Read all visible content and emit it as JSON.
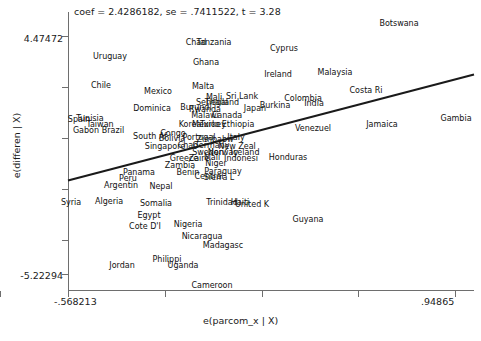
{
  "chart_data": {
    "type": "scatter",
    "title": "coef = 2.4286182, se = .7411522, t = 3.28",
    "xlabel": "e(parcom_x | X)",
    "ylabel": "e(differen | X)",
    "xlim": [
      -0.568213,
      0.94865
    ],
    "ylim": [
      -5.22294,
      4.47472
    ],
    "xticklabels": [
      "-.568213",
      ".94865"
    ],
    "yticklabels": [
      "4.47472",
      "-5.22294"
    ],
    "grid": false,
    "legend": null,
    "marker_style": "text-label",
    "n_xticks": 6,
    "n_yticks": 6,
    "fit_line": {
      "slope": 2.4286182,
      "se": 0.7411522,
      "t": 3.28,
      "color": "#1a1a1a",
      "x_start": -0.568213,
      "x_end": 0.94865
    },
    "points": [
      {
        "label": "Botswana",
        "px": 399,
        "py": 23
      },
      {
        "label": "Chad",
        "px": 196,
        "py": 42
      },
      {
        "label": "Tanzania",
        "px": 214,
        "py": 42
      },
      {
        "label": "Cyprus",
        "px": 284,
        "py": 48
      },
      {
        "label": "Uruguay",
        "px": 110,
        "py": 56
      },
      {
        "label": "Ghana",
        "px": 206,
        "py": 62
      },
      {
        "label": "Ireland",
        "px": 278,
        "py": 74
      },
      {
        "label": "Malaysia",
        "px": 335,
        "py": 72
      },
      {
        "label": "Chile",
        "px": 101,
        "py": 85
      },
      {
        "label": "Mexico",
        "px": 158,
        "py": 91
      },
      {
        "label": "Malta",
        "px": 203,
        "py": 86
      },
      {
        "label": "Costa Ri",
        "px": 366,
        "py": 90
      },
      {
        "label": "Mali",
        "px": 214,
        "py": 97
      },
      {
        "label": "Sri Lank",
        "px": 242,
        "py": 96
      },
      {
        "label": "Colombia",
        "px": 303,
        "py": 98
      },
      {
        "label": "India",
        "px": 314,
        "py": 103
      },
      {
        "label": "Senegal",
        "px": 212,
        "py": 102
      },
      {
        "label": "Thailand",
        "px": 222,
        "py": 102
      },
      {
        "label": "Burkina",
        "px": 275,
        "py": 105
      },
      {
        "label": "Dominica",
        "px": 152,
        "py": 108
      },
      {
        "label": "Burundi",
        "px": 196,
        "py": 107
      },
      {
        "label": "Rwanda",
        "px": 205,
        "py": 109
      },
      {
        "label": "Japan",
        "px": 255,
        "py": 108
      },
      {
        "label": "Spain",
        "px": 79,
        "py": 119
      },
      {
        "label": "Tunisia",
        "px": 90,
        "py": 118
      },
      {
        "label": "Malawi",
        "px": 205,
        "py": 115
      },
      {
        "label": "Canada",
        "px": 227,
        "py": 115
      },
      {
        "label": "Taiwan",
        "px": 100,
        "py": 124
      },
      {
        "label": "Gabon",
        "px": 86,
        "py": 130
      },
      {
        "label": "Brazil",
        "px": 113,
        "py": 130
      },
      {
        "label": "Korea",
        "px": 190,
        "py": 124
      },
      {
        "label": "Mexico2",
        "px": 206,
        "py": 124
      },
      {
        "label": "Turkey",
        "px": 213,
        "py": 124
      },
      {
        "label": "Ethiopia",
        "px": 238,
        "py": 124
      },
      {
        "label": "Venezuel",
        "px": 313,
        "py": 128
      },
      {
        "label": "Jamaica",
        "px": 382,
        "py": 124
      },
      {
        "label": "Gambia",
        "px": 456,
        "py": 118
      },
      {
        "label": "South Af",
        "px": 150,
        "py": 136
      },
      {
        "label": "Congo",
        "px": 173,
        "py": 133
      },
      {
        "label": "Bolivia",
        "px": 172,
        "py": 138
      },
      {
        "label": "Portugal",
        "px": 199,
        "py": 137
      },
      {
        "label": "Zimbabw",
        "px": 215,
        "py": 139
      },
      {
        "label": "Italy",
        "px": 236,
        "py": 137
      },
      {
        "label": "Singapore",
        "px": 165,
        "py": 146
      },
      {
        "label": "Chad2",
        "px": 188,
        "py": 145
      },
      {
        "label": "Germany",
        "px": 211,
        "py": 145
      },
      {
        "label": "New Zeal",
        "px": 237,
        "py": 146
      },
      {
        "label": "Sweden",
        "px": 208,
        "py": 152
      },
      {
        "label": "Norway",
        "px": 223,
        "py": 152
      },
      {
        "label": "Iceland",
        "px": 245,
        "py": 152
      },
      {
        "label": "Greece",
        "px": 184,
        "py": 158
      },
      {
        "label": "Zaire",
        "px": 199,
        "py": 158
      },
      {
        "label": "Mali2",
        "px": 212,
        "py": 157
      },
      {
        "label": "Indonesi",
        "px": 241,
        "py": 158
      },
      {
        "label": "Honduras",
        "px": 288,
        "py": 157
      },
      {
        "label": "Zambia",
        "px": 180,
        "py": 165
      },
      {
        "label": "Niger",
        "px": 216,
        "py": 163
      },
      {
        "label": "Panama",
        "px": 139,
        "py": 172
      },
      {
        "label": "Benin",
        "px": 188,
        "py": 172
      },
      {
        "label": "Paraguay",
        "px": 223,
        "py": 171
      },
      {
        "label": "Peru",
        "px": 128,
        "py": 178
      },
      {
        "label": "Central",
        "px": 209,
        "py": 176
      },
      {
        "label": "Sierra L",
        "px": 219,
        "py": 177
      },
      {
        "label": "Argentin",
        "px": 121,
        "py": 185
      },
      {
        "label": "Nepal",
        "px": 161,
        "py": 186
      },
      {
        "label": "Syria",
        "px": 71,
        "py": 202
      },
      {
        "label": "Algeria",
        "px": 109,
        "py": 201
      },
      {
        "label": "Somalia",
        "px": 156,
        "py": 203
      },
      {
        "label": "Trinidad",
        "px": 222,
        "py": 202
      },
      {
        "label": "Haiti",
        "px": 240,
        "py": 202
      },
      {
        "label": "United K",
        "px": 252,
        "py": 204
      },
      {
        "label": "Egypt",
        "px": 149,
        "py": 215
      },
      {
        "label": "Cote D'I",
        "px": 145,
        "py": 226
      },
      {
        "label": "Nigeria",
        "px": 188,
        "py": 224
      },
      {
        "label": "Guyana",
        "px": 308,
        "py": 219
      },
      {
        "label": "Nicaragua",
        "px": 202,
        "py": 236
      },
      {
        "label": "Madagasc",
        "px": 223,
        "py": 245
      },
      {
        "label": "Philippi",
        "px": 167,
        "py": 259
      },
      {
        "label": "Jordan",
        "px": 122,
        "py": 265
      },
      {
        "label": "Uganda",
        "px": 183,
        "py": 265
      },
      {
        "label": "Cameroon",
        "px": 212,
        "py": 285
      }
    ]
  }
}
